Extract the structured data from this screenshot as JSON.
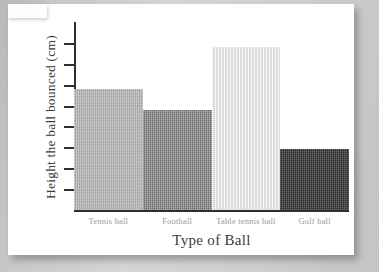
{
  "document": {
    "kind": "scanned-worksheet-page",
    "page_background": "#ffffff",
    "surround_background": "#cfcfcf"
  },
  "chart_data": {
    "type": "bar",
    "title": "",
    "xlabel": "Type of Ball",
    "ylabel": "Height the ball bounced (cm)",
    "categories": [
      "Tennis ball",
      "Football",
      "Table tennis ball",
      "Golf ball"
    ],
    "values": [
      5.8,
      4.8,
      7.8,
      2.9
    ],
    "ylim": [
      0,
      9
    ],
    "yticks": [
      1,
      2,
      3,
      4,
      5,
      6,
      7,
      8
    ],
    "ytick_labels": [
      "",
      "",
      "",
      "",
      "",
      "",
      "",
      ""
    ],
    "grid": false,
    "legend": false,
    "bar_colors": [
      "#b6b6b6",
      "#8d8e8d",
      "#e9e9e9",
      "#494949"
    ],
    "axis_color": "#2e2e2e",
    "category_label_color": "#9a9a9a",
    "axis_title_color": "#3b3b3b"
  },
  "axes": {
    "y_axis_name": "y-axis-line",
    "x_axis_name": "x-axis-line",
    "tick_count": 8
  }
}
